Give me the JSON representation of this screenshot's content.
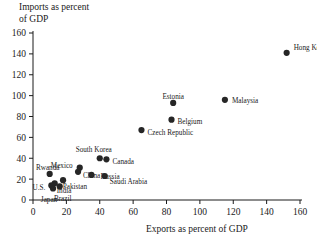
{
  "chart_data": {
    "type": "scatter",
    "title": "",
    "xlabel": "Exports as percent of GDP",
    "ylabel": "Imports as percent of GDP",
    "xlim": [
      0,
      160
    ],
    "ylim": [
      0,
      160
    ],
    "xticks": [
      0,
      20,
      40,
      60,
      80,
      100,
      120,
      140,
      160
    ],
    "yticks": [
      0,
      20,
      40,
      60,
      80,
      100,
      120,
      140,
      160
    ],
    "grid": false,
    "legend": "none",
    "marker_color": "#262626",
    "points": [
      {
        "label": "Hong Kong",
        "x": 152,
        "y": 141,
        "label_dx": 7,
        "label_dy": -5,
        "anchor": "start"
      },
      {
        "label": "Malaysia",
        "x": 115,
        "y": 96,
        "label_dx": 7,
        "label_dy": 1,
        "anchor": "start"
      },
      {
        "label": "Estonia",
        "x": 84,
        "y": 93,
        "label_dx": 0,
        "label_dy": -7,
        "anchor": "middle"
      },
      {
        "label": "Belgium",
        "x": 83,
        "y": 77,
        "label_dx": 6,
        "label_dy": 2,
        "anchor": "start"
      },
      {
        "label": "Czech Republic",
        "x": 65,
        "y": 67,
        "label_dx": 6,
        "label_dy": 2,
        "anchor": "start"
      },
      {
        "label": "South Korea",
        "x": 40,
        "y": 40,
        "label_dx": -6,
        "label_dy": -9,
        "anchor": "middle"
      },
      {
        "label": "Canada",
        "x": 44,
        "y": 39,
        "label_dx": 6,
        "label_dy": 2,
        "anchor": "start"
      },
      {
        "label": "Mexico",
        "x": 28,
        "y": 31,
        "label_dx": -7,
        "label_dy": -2,
        "anchor": "end"
      },
      {
        "label": "China",
        "x": 27,
        "y": 27,
        "label_dx": 5,
        "label_dy": 4,
        "anchor": "start"
      },
      {
        "label": "Rwanda",
        "x": 10,
        "y": 25,
        "label_dx": -2,
        "label_dy": -7,
        "anchor": "middle"
      },
      {
        "label": "Russia",
        "x": 35,
        "y": 24,
        "label_dx": 9,
        "label_dy": 1,
        "anchor": "start"
      },
      {
        "label": "Saudi Arabia",
        "x": 43,
        "y": 23,
        "label_dx": 5,
        "label_dy": 5,
        "anchor": "start"
      },
      {
        "label": "India",
        "x": 18,
        "y": 19,
        "label_dx": 1,
        "label_dy": 10,
        "anchor": "middle"
      },
      {
        "label": "Pakistan",
        "x": 13,
        "y": 16,
        "label_dx": 8,
        "label_dy": 3,
        "anchor": "start"
      },
      {
        "label": "U.S.",
        "x": 11,
        "y": 14,
        "label_dx": -6,
        "label_dy": 2,
        "anchor": "end"
      },
      {
        "label": "Brazil",
        "x": 16,
        "y": 13,
        "label_dx": 3,
        "label_dy": 12,
        "anchor": "middle"
      },
      {
        "label": "Japan",
        "x": 12,
        "y": 11,
        "label_dx": -4,
        "label_dy": 11,
        "anchor": "middle"
      }
    ]
  },
  "axes": {
    "y_title_text": "Imports as percent\nof GDP",
    "x_title_text": "Exports as percent of GDP"
  }
}
